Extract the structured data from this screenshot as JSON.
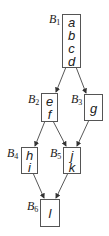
{
  "diagram": {
    "type": "control-flow-graph",
    "blocks": [
      {
        "id": "B1",
        "label": "B",
        "sub": "1",
        "statements": [
          "a",
          "b",
          "c",
          "d"
        ]
      },
      {
        "id": "B2",
        "label": "B",
        "sub": "2",
        "statements": [
          "e",
          "f"
        ]
      },
      {
        "id": "B3",
        "label": "B",
        "sub": "3",
        "statements": [
          "g"
        ]
      },
      {
        "id": "B4",
        "label": "B",
        "sub": "4",
        "statements": [
          "h",
          "i"
        ]
      },
      {
        "id": "B5",
        "label": "B",
        "sub": "5",
        "statements": [
          "j",
          "k"
        ]
      },
      {
        "id": "B6",
        "label": "B",
        "sub": "6",
        "statements": [
          "l"
        ]
      }
    ],
    "edges": [
      {
        "from": "B1",
        "to": "B2"
      },
      {
        "from": "B1",
        "to": "B3"
      },
      {
        "from": "B2",
        "to": "B4"
      },
      {
        "from": "B2",
        "to": "B5"
      },
      {
        "from": "B3",
        "to": "B5"
      },
      {
        "from": "B4",
        "to": "B6"
      },
      {
        "from": "B5",
        "to": "B6"
      }
    ],
    "colors": {
      "stroke": "#555555",
      "text": "#222222",
      "background": "#ffffff"
    }
  }
}
